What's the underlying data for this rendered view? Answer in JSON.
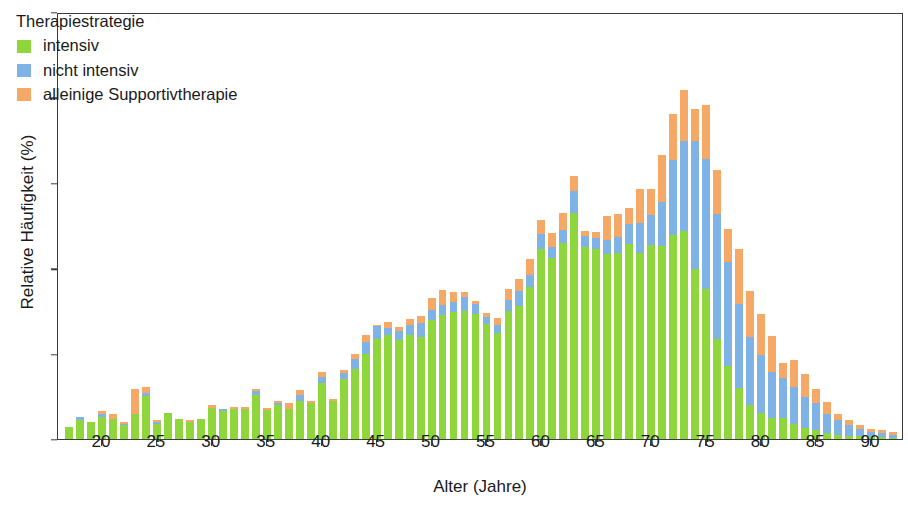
{
  "chart_data": {
    "type": "bar",
    "barmode": "stacked",
    "title": "",
    "xlabel": "Alter (Jahre)",
    "ylabel": "Relative Häufigkeit (%)",
    "xlim": [
      16,
      93
    ],
    "ylim": [
      0,
      5
    ],
    "xticks": [
      20,
      25,
      30,
      35,
      40,
      45,
      50,
      55,
      60,
      65,
      70,
      75,
      80,
      85,
      90
    ],
    "yticks": [
      0,
      1,
      2,
      3,
      4,
      5
    ],
    "grid": false,
    "legend": {
      "title": "Therapiestrategie",
      "position": "top-left",
      "entries": [
        {
          "label": "intensiv",
          "color": "#8ed63c"
        },
        {
          "label": "nicht intensiv",
          "color": "#7fb2e5"
        },
        {
          "label": "alleinige Supportivtherapie",
          "color": "#f6a966"
        }
      ]
    },
    "categories": [
      17,
      18,
      19,
      20,
      21,
      22,
      23,
      24,
      25,
      26,
      27,
      28,
      29,
      30,
      31,
      32,
      33,
      34,
      35,
      36,
      37,
      38,
      39,
      40,
      41,
      42,
      43,
      44,
      45,
      46,
      47,
      48,
      49,
      50,
      51,
      52,
      53,
      54,
      55,
      56,
      57,
      58,
      59,
      60,
      61,
      62,
      63,
      64,
      65,
      66,
      67,
      68,
      69,
      70,
      71,
      72,
      73,
      74,
      75,
      76,
      77,
      78,
      79,
      80,
      81,
      82,
      83,
      84,
      85,
      86,
      87,
      88,
      89,
      90,
      91,
      92
    ],
    "series": [
      {
        "name": "intensiv",
        "color": "#8ed63c",
        "values": [
          0.14,
          0.22,
          0.2,
          0.26,
          0.23,
          0.16,
          0.29,
          0.5,
          0.17,
          0.31,
          0.23,
          0.2,
          0.24,
          0.36,
          0.33,
          0.35,
          0.35,
          0.52,
          0.34,
          0.4,
          0.35,
          0.44,
          0.42,
          0.66,
          0.44,
          0.7,
          0.82,
          1.0,
          1.17,
          1.22,
          1.16,
          1.22,
          1.2,
          1.39,
          1.45,
          1.49,
          1.5,
          1.46,
          1.35,
          1.24,
          1.5,
          1.56,
          1.78,
          2.23,
          2.12,
          2.3,
          2.65,
          2.25,
          2.22,
          2.17,
          2.18,
          2.28,
          2.18,
          2.27,
          2.26,
          2.39,
          2.44,
          1.99,
          1.76,
          1.17,
          0.85,
          0.6,
          0.4,
          0.3,
          0.25,
          0.25,
          0.17,
          0.13,
          0.1,
          0.07,
          0.05,
          0.04,
          0.03,
          0.02,
          0.02,
          0.01
        ]
      },
      {
        "name": "nicht intensiv",
        "color": "#7fb2e5",
        "values": [
          0.0,
          0.04,
          0.0,
          0.03,
          0.0,
          0.02,
          0.0,
          0.04,
          0.03,
          0.0,
          0.0,
          0.0,
          0.0,
          0.0,
          0.02,
          0.0,
          0.0,
          0.04,
          0.0,
          0.02,
          0.0,
          0.08,
          0.0,
          0.07,
          0.0,
          0.07,
          0.12,
          0.14,
          0.15,
          0.08,
          0.1,
          0.11,
          0.16,
          0.12,
          0.12,
          0.11,
          0.16,
          0.12,
          0.08,
          0.1,
          0.13,
          0.17,
          0.14,
          0.17,
          0.13,
          0.15,
          0.25,
          0.13,
          0.13,
          0.16,
          0.18,
          0.24,
          0.35,
          0.35,
          0.51,
          0.88,
          1.05,
          1.5,
          1.52,
          1.46,
          1.22,
          0.98,
          0.8,
          0.68,
          0.54,
          0.47,
          0.44,
          0.36,
          0.32,
          0.22,
          0.17,
          0.12,
          0.09,
          0.06,
          0.05,
          0.04
        ]
      },
      {
        "name": "alleinige Supportivtherapie",
        "color": "#f6a966",
        "values": [
          0.0,
          0.0,
          0.0,
          0.04,
          0.06,
          0.02,
          0.3,
          0.07,
          0.02,
          0.0,
          0.0,
          0.02,
          0.0,
          0.04,
          0.0,
          0.02,
          0.03,
          0.03,
          0.02,
          0.03,
          0.07,
          0.06,
          0.03,
          0.05,
          0.03,
          0.04,
          0.05,
          0.08,
          0.02,
          0.07,
          0.05,
          0.07,
          0.08,
          0.14,
          0.18,
          0.12,
          0.06,
          0.04,
          0.04,
          0.08,
          0.13,
          0.14,
          0.19,
          0.17,
          0.16,
          0.2,
          0.18,
          0.06,
          0.07,
          0.28,
          0.27,
          0.18,
          0.4,
          0.31,
          0.55,
          0.54,
          0.6,
          0.38,
          0.63,
          0.52,
          0.39,
          0.64,
          0.53,
          0.48,
          0.42,
          0.17,
          0.31,
          0.27,
          0.17,
          0.14,
          0.07,
          0.06,
          0.05,
          0.04,
          0.03,
          0.03
        ]
      }
    ]
  }
}
